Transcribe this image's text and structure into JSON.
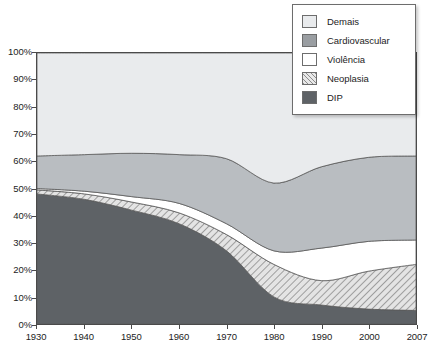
{
  "chart_data": {
    "type": "area",
    "stacked": true,
    "normalized_percent": true,
    "title": "",
    "subtitle": "",
    "xlabel": "",
    "ylabel": "",
    "x": [
      1930,
      1940,
      1950,
      1960,
      1970,
      1980,
      1990,
      2000,
      2007
    ],
    "xticklabels": [
      "1930",
      "1940",
      "1950",
      "1960",
      "1970",
      "1980",
      "1990",
      "2000",
      "2007"
    ],
    "yticks": [
      0,
      10,
      20,
      30,
      40,
      50,
      60,
      70,
      80,
      90,
      100
    ],
    "yticklabels": [
      "0%",
      "10%",
      "20%",
      "30%",
      "40%",
      "50%",
      "60%",
      "70%",
      "80%",
      "90%",
      "100%"
    ],
    "ylim": [
      0,
      100
    ],
    "grid": false,
    "legend_position": "top-right",
    "series": [
      {
        "name": "DIP",
        "color": "#5e6266",
        "pattern": "solid",
        "values": [
          48,
          46,
          42,
          37,
          27,
          10,
          7,
          5.5,
          5
        ]
      },
      {
        "name": "Neoplasia",
        "color": "#dcdcdc",
        "pattern": "hatch",
        "values": [
          1.5,
          2.0,
          3.0,
          4.0,
          6.0,
          12.0,
          9.0,
          14.0,
          17.0
        ]
      },
      {
        "name": "Violência",
        "color": "#ffffff",
        "pattern": "solid",
        "values": [
          0.5,
          1.0,
          2.0,
          3.5,
          4.0,
          5.0,
          12.0,
          11.0,
          9.0
        ]
      },
      {
        "name": "Cardiovascular",
        "color": "#b9bdc1",
        "pattern": "solid",
        "values": [
          12.0,
          13.5,
          16.0,
          18.0,
          24.0,
          25.0,
          30.0,
          31.0,
          31.0
        ]
      },
      {
        "name": "Demais",
        "color": "#e9ebed",
        "pattern": "solid",
        "values": [
          38.0,
          37.5,
          37.0,
          37.5,
          39.0,
          48.0,
          42.0,
          38.5,
          38.0
        ]
      }
    ],
    "cumulative_tops": {
      "DIP": [
        48,
        46,
        42,
        37,
        27,
        10,
        7,
        5.5,
        5
      ],
      "Neoplasia": [
        49.5,
        48,
        45,
        41,
        33,
        22,
        16,
        19.5,
        22
      ],
      "Violência": [
        50,
        49,
        47,
        44.5,
        37,
        27,
        28,
        30.5,
        31
      ],
      "Cardiovascular": [
        62,
        62.5,
        63,
        62.5,
        61,
        52,
        58,
        61.5,
        62
      ],
      "Demais": [
        100,
        100,
        100,
        100,
        100,
        100,
        100,
        100,
        100
      ]
    }
  },
  "legend": {
    "items": [
      {
        "label": "Demais",
        "swatch": "#e9ebed",
        "pattern": "solid"
      },
      {
        "label": "Cardiovascular",
        "swatch": "#9a9ea2",
        "pattern": "solid"
      },
      {
        "label": "Violência",
        "swatch": "#ffffff",
        "pattern": "solid"
      },
      {
        "label": "Neoplasia",
        "swatch": "#dcdcdc",
        "pattern": "hatch"
      },
      {
        "label": "DIP",
        "swatch": "#5e6266",
        "pattern": "solid"
      }
    ]
  },
  "colors": {
    "axis": "#4a4a4a",
    "text": "#1d1d1d",
    "background": "#ffffff",
    "legend_border": "#6d6d6d"
  }
}
